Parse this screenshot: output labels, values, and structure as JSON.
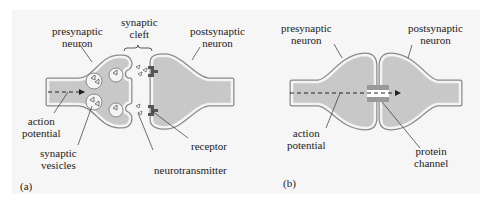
{
  "figure": {
    "panel_a": {
      "tag": "(a)",
      "labels": {
        "presynaptic": [
          "presynaptic",
          "neuron"
        ],
        "cleft": [
          "synaptic",
          "cleft"
        ],
        "postsynaptic": [
          "postsynaptic",
          "neuron"
        ],
        "action": [
          "action",
          "potential"
        ],
        "vesicles": [
          "synaptic",
          "vesicles"
        ],
        "receptor": "receptor",
        "neurotransmitter": "neurotransmitter"
      }
    },
    "panel_b": {
      "tag": "(b)",
      "labels": {
        "presynaptic": [
          "presynaptic",
          "neuron"
        ],
        "postsynaptic": [
          "postsynaptic",
          "neuron"
        ],
        "action": [
          "action",
          "potential"
        ],
        "channel": [
          "protein",
          "channel"
        ]
      }
    },
    "colors": {
      "background": "#f6f6f6",
      "cell_fill": "#c8c8c8",
      "membrane": "#8a8a8a",
      "receptor": "#555555"
    }
  }
}
